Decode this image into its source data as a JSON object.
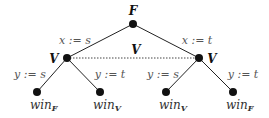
{
  "root": {
    "player": "F"
  },
  "edges_root": [
    {
      "label": "x := s"
    },
    {
      "label": "x := t"
    }
  ],
  "info_set": {
    "label": "V"
  },
  "left": {
    "player": "V",
    "edges": [
      {
        "label": "y := s"
      },
      {
        "label": "y := t"
      }
    ],
    "leaves": [
      {
        "text": "win",
        "sub": "F"
      },
      {
        "text": "win",
        "sub": "V"
      }
    ]
  },
  "right": {
    "player": "V",
    "edges": [
      {
        "label": "y := s"
      },
      {
        "label": "y := t"
      }
    ],
    "leaves": [
      {
        "text": "win",
        "sub": "V"
      },
      {
        "text": "win",
        "sub": "F"
      }
    ]
  }
}
